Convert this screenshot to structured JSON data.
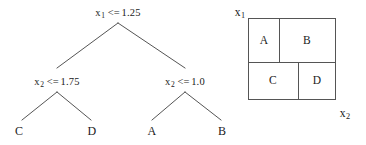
{
  "figure": {
    "type": "decision-tree-with-partition",
    "tree": {
      "root": {
        "variable": "x",
        "subscript": "1",
        "operator": "<=",
        "threshold": "1.25",
        "full_text": "x1 <= 1.25"
      },
      "internal_left": {
        "variable": "x",
        "subscript": "2",
        "operator": "<=",
        "threshold": "1.75",
        "full_text": "x2 <= 1.75"
      },
      "internal_right": {
        "variable": "x",
        "subscript": "2",
        "operator": "<=",
        "threshold": "1.0",
        "full_text": "x2 <= 1.0"
      },
      "leaves": [
        {
          "label": "C"
        },
        {
          "label": "D"
        },
        {
          "label": "A"
        },
        {
          "label": "B"
        }
      ]
    },
    "partition": {
      "axis_vertical": {
        "variable": "x",
        "subscript": "1"
      },
      "axis_horizontal": {
        "variable": "x",
        "subscript": "2"
      },
      "regions": [
        {
          "label": "A"
        },
        {
          "label": "B"
        },
        {
          "label": "C"
        },
        {
          "label": "D"
        }
      ]
    },
    "colors": {
      "line": "#555555",
      "text": "#1a1a1a",
      "background": "#ffffff"
    }
  }
}
